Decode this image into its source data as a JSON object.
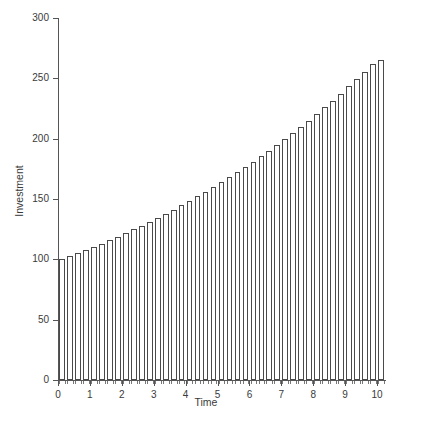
{
  "chart_data": {
    "type": "bar",
    "title": "",
    "subtitle": "",
    "xlabel": "Time",
    "ylabel": "Investment",
    "xlim": [
      0,
      10.25
    ],
    "ylim": [
      0,
      300
    ],
    "grid": false,
    "legend": null,
    "x_tick_labels": [
      "0",
      "1",
      "2",
      "3",
      "4",
      "5",
      "6",
      "7",
      "8",
      "9",
      "10"
    ],
    "x_tick_values": [
      0,
      1,
      2,
      3,
      4,
      5,
      6,
      7,
      8,
      9,
      10
    ],
    "y_tick_labels": [
      "0",
      "50",
      "100",
      "150",
      "200",
      "250",
      "300"
    ],
    "y_tick_values": [
      0,
      50,
      100,
      150,
      200,
      250,
      300
    ],
    "bar_style": {
      "fill": "#ffffff",
      "edge": "#4a4a4a",
      "edge_width": 1,
      "width_fraction": 0.72
    },
    "x": [
      0,
      0.25,
      0.5,
      0.75,
      1,
      1.25,
      1.5,
      1.75,
      2,
      2.25,
      2.5,
      2.75,
      3,
      3.25,
      3.5,
      3.75,
      4,
      4.25,
      4.5,
      4.75,
      5,
      5.25,
      5.5,
      5.75,
      6,
      6.25,
      6.5,
      6.75,
      7,
      7.25,
      7.5,
      7.75,
      8,
      8.25,
      8.5,
      8.75,
      9,
      9.25,
      9.5,
      9.75,
      10
    ],
    "values": [
      100.0,
      102.5,
      105.1,
      107.7,
      110.4,
      113.1,
      115.9,
      118.9,
      121.8,
      124.9,
      128.0,
      131.2,
      134.5,
      137.9,
      141.3,
      144.8,
      148.4,
      152.2,
      156.0,
      159.9,
      163.9,
      168.0,
      172.2,
      176.5,
      180.9,
      185.4,
      190.0,
      194.8,
      199.7,
      204.7,
      209.8,
      215.0,
      220.4,
      225.9,
      231.5,
      237.3,
      243.3,
      249.4,
      255.6,
      262.0,
      265.3
    ],
    "annotations": []
  },
  "caption": {
    "text": "",
    "visible": false
  }
}
